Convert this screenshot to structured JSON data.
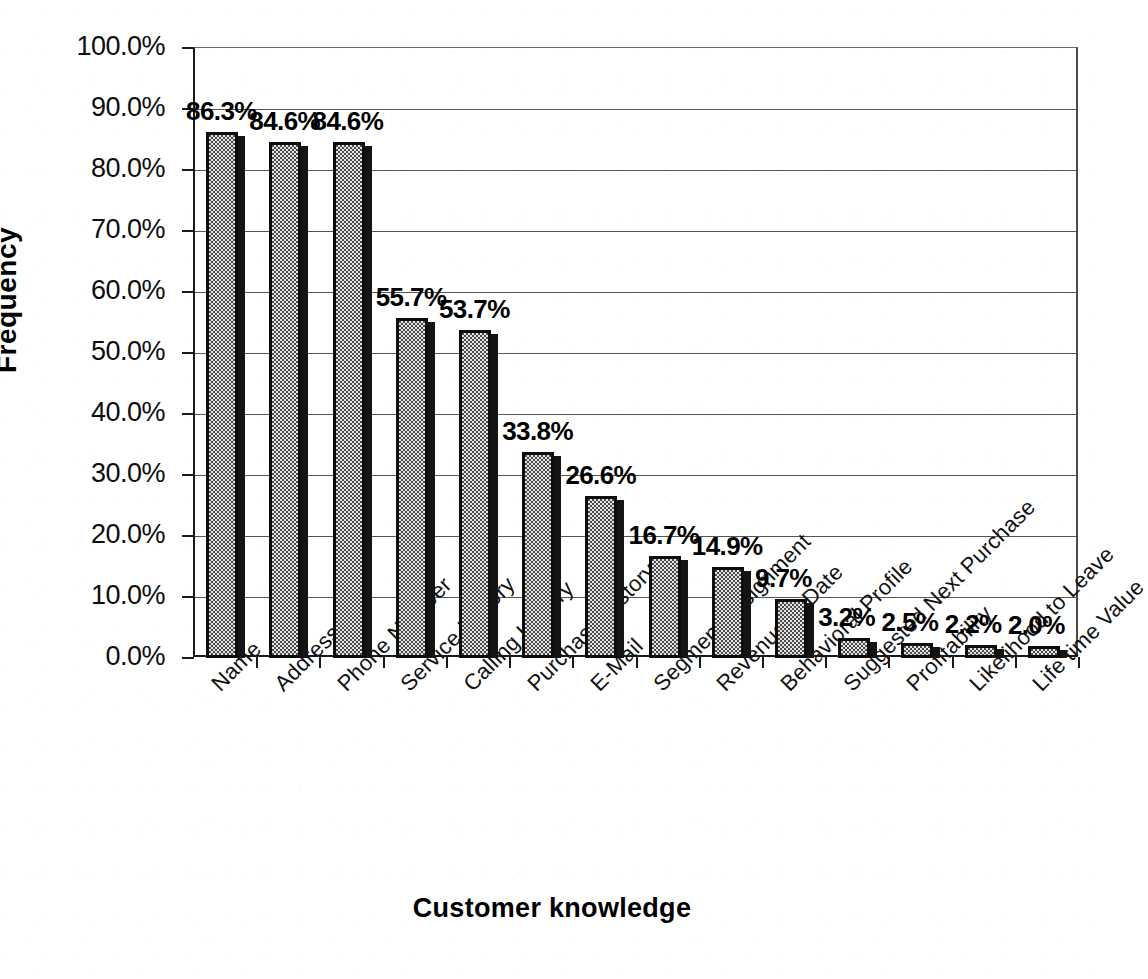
{
  "chart_data": {
    "type": "bar",
    "title": "",
    "xlabel": "Customer knowledge",
    "ylabel": "Frequency",
    "ylim": [
      0,
      100
    ],
    "ytick_labels": [
      "0.0%",
      "10.0%",
      "20.0%",
      "30.0%",
      "40.0%",
      "50.0%",
      "60.0%",
      "70.0%",
      "80.0%",
      "90.0%",
      "100.0%"
    ],
    "ytick_values": [
      0,
      10,
      20,
      30,
      40,
      50,
      60,
      70,
      80,
      90,
      100
    ],
    "grid": true,
    "legend": "none",
    "categories": [
      "Name",
      "Address",
      "Phone Number",
      "Service History",
      "Calling History",
      "Purchase History",
      "E-Mail",
      "Segment Assignment",
      "Revenue to Date",
      "Behavioral Profile",
      "Suggested Next Purchase",
      "Profitability",
      "Likelihood to Leave",
      "Life time Value"
    ],
    "values": [
      86.3,
      84.6,
      84.6,
      55.7,
      53.7,
      33.8,
      26.6,
      16.7,
      14.9,
      9.7,
      3.2,
      2.5,
      2.2,
      2.0
    ],
    "data_labels": [
      "86.3%",
      "84.6%",
      "84.6%",
      "55.7%",
      "53.7%",
      "33.8%",
      "26.6%",
      "16.7%",
      "14.9%",
      "9.7%",
      "3.2%",
      "2.5%",
      "2.2%",
      "2.0%"
    ],
    "bar_fill": "#e4e4e4",
    "bar_outline": "#0d0d0d",
    "bar_shadow": "#141414",
    "background": "#ffffff",
    "gridline_color": "#555555"
  }
}
